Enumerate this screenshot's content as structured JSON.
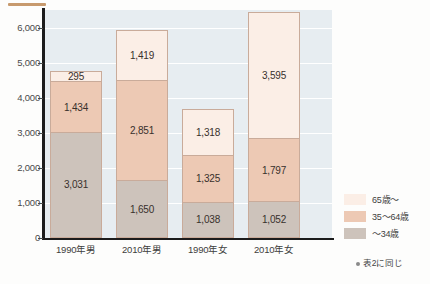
{
  "chart_data": {
    "type": "bar",
    "stacked": true,
    "title": "",
    "xlabel": "",
    "ylabel": "",
    "ylim": [
      0,
      6500
    ],
    "yticks": [
      "0",
      "1,000",
      "2,000",
      "3,000",
      "4,000",
      "5,000",
      "6,000"
    ],
    "ytick_values": [
      0,
      1000,
      2000,
      3000,
      4000,
      5000,
      6000
    ],
    "grid": true,
    "legend_position": "right",
    "categories": [
      "1990年男",
      "2010年男",
      "1990年女",
      "2010年女"
    ],
    "series": [
      {
        "name": "~34歳",
        "key": "seg-34",
        "color": "#cdc3bb",
        "values": [
          3031,
          1650,
          1038,
          1052
        ],
        "labels": [
          "3,031",
          "1,650",
          "1,038",
          "1,052"
        ]
      },
      {
        "name": "35~64歳",
        "key": "seg-3564",
        "color": "#edc9b4",
        "values": [
          1434,
          2851,
          1325,
          1797
        ],
        "labels": [
          "1,434",
          "2,851",
          "1,325",
          "1,797"
        ]
      },
      {
        "name": "65歳~",
        "key": "seg-65",
        "color": "#fbeee6",
        "values": [
          295,
          1419,
          1318,
          3595
        ],
        "labels": [
          "295",
          "1,419",
          "1,318",
          "3,595"
        ]
      }
    ],
    "totals": [
      4760,
      5920,
      3681,
      6444
    ],
    "legend": [
      {
        "label": "65歳～",
        "color": "#fbeee6"
      },
      {
        "label": "35～64歳",
        "color": "#edc9b4"
      },
      {
        "label": "～34歳",
        "color": "#cdc3bb"
      }
    ],
    "footnote": "表2に同じ",
    "plot_background": "#e7edf1",
    "axis_color": "#1c1c1c"
  }
}
